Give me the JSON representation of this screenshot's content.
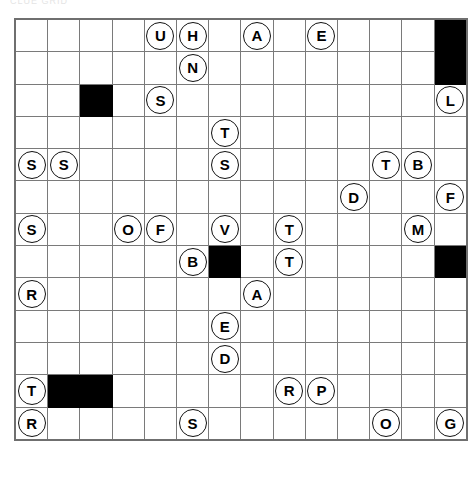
{
  "page": {
    "header_artifact_text": "CLUE GRID"
  },
  "grid": {
    "columns": 14,
    "rows": 13,
    "cell_size_px": 31,
    "grid_line_color": "#7a7a7a",
    "blocked_cell_color": "#000000",
    "token_text_color": "#000000",
    "token_fill_color": "#ffffff",
    "cells": [
      [
        {
          "letter": "",
          "blocked": false
        },
        {
          "letter": "",
          "blocked": false
        },
        {
          "letter": "",
          "blocked": false
        },
        {
          "letter": "",
          "blocked": false
        },
        {
          "letter": "U",
          "blocked": false
        },
        {
          "letter": "H",
          "blocked": false
        },
        {
          "letter": "",
          "blocked": false
        },
        {
          "letter": "A",
          "blocked": false
        },
        {
          "letter": "",
          "blocked": false
        },
        {
          "letter": "E",
          "blocked": false
        },
        {
          "letter": "",
          "blocked": false
        },
        {
          "letter": "",
          "blocked": false
        },
        {
          "letter": "",
          "blocked": false
        },
        {
          "letter": "",
          "blocked": true
        }
      ],
      [
        {
          "letter": "",
          "blocked": false
        },
        {
          "letter": "",
          "blocked": false
        },
        {
          "letter": "",
          "blocked": false
        },
        {
          "letter": "",
          "blocked": false
        },
        {
          "letter": "",
          "blocked": false
        },
        {
          "letter": "N",
          "blocked": false
        },
        {
          "letter": "",
          "blocked": false
        },
        {
          "letter": "",
          "blocked": false
        },
        {
          "letter": "",
          "blocked": false
        },
        {
          "letter": "",
          "blocked": false
        },
        {
          "letter": "",
          "blocked": false
        },
        {
          "letter": "",
          "blocked": false
        },
        {
          "letter": "",
          "blocked": false
        },
        {
          "letter": "",
          "blocked": true
        }
      ],
      [
        {
          "letter": "",
          "blocked": false
        },
        {
          "letter": "",
          "blocked": false
        },
        {
          "letter": "",
          "blocked": true
        },
        {
          "letter": "",
          "blocked": false
        },
        {
          "letter": "S",
          "blocked": false
        },
        {
          "letter": "",
          "blocked": false
        },
        {
          "letter": "",
          "blocked": false
        },
        {
          "letter": "",
          "blocked": false
        },
        {
          "letter": "",
          "blocked": false
        },
        {
          "letter": "",
          "blocked": false
        },
        {
          "letter": "",
          "blocked": false
        },
        {
          "letter": "",
          "blocked": false
        },
        {
          "letter": "",
          "blocked": false
        },
        {
          "letter": "L",
          "blocked": false
        }
      ],
      [
        {
          "letter": "",
          "blocked": false
        },
        {
          "letter": "",
          "blocked": false
        },
        {
          "letter": "",
          "blocked": false
        },
        {
          "letter": "",
          "blocked": false
        },
        {
          "letter": "",
          "blocked": false
        },
        {
          "letter": "",
          "blocked": false
        },
        {
          "letter": "T",
          "blocked": false
        },
        {
          "letter": "",
          "blocked": false
        },
        {
          "letter": "",
          "blocked": false
        },
        {
          "letter": "",
          "blocked": false
        },
        {
          "letter": "",
          "blocked": false
        },
        {
          "letter": "",
          "blocked": false
        },
        {
          "letter": "",
          "blocked": false
        },
        {
          "letter": "",
          "blocked": false
        }
      ],
      [
        {
          "letter": "S",
          "blocked": false
        },
        {
          "letter": "S",
          "blocked": false
        },
        {
          "letter": "",
          "blocked": false
        },
        {
          "letter": "",
          "blocked": false
        },
        {
          "letter": "",
          "blocked": false
        },
        {
          "letter": "",
          "blocked": false
        },
        {
          "letter": "S",
          "blocked": false
        },
        {
          "letter": "",
          "blocked": false
        },
        {
          "letter": "",
          "blocked": false
        },
        {
          "letter": "",
          "blocked": false
        },
        {
          "letter": "",
          "blocked": false
        },
        {
          "letter": "T",
          "blocked": false
        },
        {
          "letter": "B",
          "blocked": false
        },
        {
          "letter": "",
          "blocked": false
        }
      ],
      [
        {
          "letter": "",
          "blocked": false
        },
        {
          "letter": "",
          "blocked": false
        },
        {
          "letter": "",
          "blocked": false
        },
        {
          "letter": "",
          "blocked": false
        },
        {
          "letter": "",
          "blocked": false
        },
        {
          "letter": "",
          "blocked": false
        },
        {
          "letter": "",
          "blocked": false
        },
        {
          "letter": "",
          "blocked": false
        },
        {
          "letter": "",
          "blocked": false
        },
        {
          "letter": "",
          "blocked": false
        },
        {
          "letter": "D",
          "blocked": false
        },
        {
          "letter": "",
          "blocked": false
        },
        {
          "letter": "",
          "blocked": false
        },
        {
          "letter": "F",
          "blocked": false
        }
      ],
      [
        {
          "letter": "S",
          "blocked": false
        },
        {
          "letter": "",
          "blocked": false
        },
        {
          "letter": "",
          "blocked": false
        },
        {
          "letter": "O",
          "blocked": false
        },
        {
          "letter": "F",
          "blocked": false
        },
        {
          "letter": "",
          "blocked": false
        },
        {
          "letter": "V",
          "blocked": false
        },
        {
          "letter": "",
          "blocked": false
        },
        {
          "letter": "T",
          "blocked": false
        },
        {
          "letter": "",
          "blocked": false
        },
        {
          "letter": "",
          "blocked": false
        },
        {
          "letter": "",
          "blocked": false
        },
        {
          "letter": "M",
          "blocked": false
        },
        {
          "letter": "",
          "blocked": false
        }
      ],
      [
        {
          "letter": "",
          "blocked": false
        },
        {
          "letter": "",
          "blocked": false
        },
        {
          "letter": "",
          "blocked": false
        },
        {
          "letter": "",
          "blocked": false
        },
        {
          "letter": "",
          "blocked": false
        },
        {
          "letter": "B",
          "blocked": false
        },
        {
          "letter": "",
          "blocked": true
        },
        {
          "letter": "",
          "blocked": false
        },
        {
          "letter": "T",
          "blocked": false
        },
        {
          "letter": "",
          "blocked": false
        },
        {
          "letter": "",
          "blocked": false
        },
        {
          "letter": "",
          "blocked": false
        },
        {
          "letter": "",
          "blocked": false
        },
        {
          "letter": "",
          "blocked": true
        }
      ],
      [
        {
          "letter": "R",
          "blocked": false
        },
        {
          "letter": "",
          "blocked": false
        },
        {
          "letter": "",
          "blocked": false
        },
        {
          "letter": "",
          "blocked": false
        },
        {
          "letter": "",
          "blocked": false
        },
        {
          "letter": "",
          "blocked": false
        },
        {
          "letter": "",
          "blocked": false
        },
        {
          "letter": "A",
          "blocked": false
        },
        {
          "letter": "",
          "blocked": false
        },
        {
          "letter": "",
          "blocked": false
        },
        {
          "letter": "",
          "blocked": false
        },
        {
          "letter": "",
          "blocked": false
        },
        {
          "letter": "",
          "blocked": false
        },
        {
          "letter": "",
          "blocked": false
        }
      ],
      [
        {
          "letter": "",
          "blocked": false
        },
        {
          "letter": "",
          "blocked": false
        },
        {
          "letter": "",
          "blocked": false
        },
        {
          "letter": "",
          "blocked": false
        },
        {
          "letter": "",
          "blocked": false
        },
        {
          "letter": "",
          "blocked": false
        },
        {
          "letter": "E",
          "blocked": false
        },
        {
          "letter": "",
          "blocked": false
        },
        {
          "letter": "",
          "blocked": false
        },
        {
          "letter": "",
          "blocked": false
        },
        {
          "letter": "",
          "blocked": false
        },
        {
          "letter": "",
          "blocked": false
        },
        {
          "letter": "",
          "blocked": false
        },
        {
          "letter": "",
          "blocked": false
        }
      ],
      [
        {
          "letter": "",
          "blocked": false
        },
        {
          "letter": "",
          "blocked": false
        },
        {
          "letter": "",
          "blocked": false
        },
        {
          "letter": "",
          "blocked": false
        },
        {
          "letter": "",
          "blocked": false
        },
        {
          "letter": "",
          "blocked": false
        },
        {
          "letter": "D",
          "blocked": false
        },
        {
          "letter": "",
          "blocked": false
        },
        {
          "letter": "",
          "blocked": false
        },
        {
          "letter": "",
          "blocked": false
        },
        {
          "letter": "",
          "blocked": false
        },
        {
          "letter": "",
          "blocked": false
        },
        {
          "letter": "",
          "blocked": false
        },
        {
          "letter": "",
          "blocked": false
        }
      ],
      [
        {
          "letter": "T",
          "blocked": false
        },
        {
          "letter": "",
          "blocked": true
        },
        {
          "letter": "",
          "blocked": true
        },
        {
          "letter": "",
          "blocked": false
        },
        {
          "letter": "",
          "blocked": false
        },
        {
          "letter": "",
          "blocked": false
        },
        {
          "letter": "",
          "blocked": false
        },
        {
          "letter": "",
          "blocked": false
        },
        {
          "letter": "R",
          "blocked": false
        },
        {
          "letter": "P",
          "blocked": false
        },
        {
          "letter": "",
          "blocked": false
        },
        {
          "letter": "",
          "blocked": false
        },
        {
          "letter": "",
          "blocked": false
        },
        {
          "letter": "",
          "blocked": false
        }
      ],
      [
        {
          "letter": "R",
          "blocked": false
        },
        {
          "letter": "",
          "blocked": false
        },
        {
          "letter": "",
          "blocked": false
        },
        {
          "letter": "",
          "blocked": false
        },
        {
          "letter": "",
          "blocked": false
        },
        {
          "letter": "S",
          "blocked": false
        },
        {
          "letter": "",
          "blocked": false
        },
        {
          "letter": "",
          "blocked": false
        },
        {
          "letter": "",
          "blocked": false
        },
        {
          "letter": "",
          "blocked": false
        },
        {
          "letter": "",
          "blocked": false
        },
        {
          "letter": "O",
          "blocked": false
        },
        {
          "letter": "",
          "blocked": false
        },
        {
          "letter": "G",
          "blocked": false
        }
      ]
    ]
  }
}
